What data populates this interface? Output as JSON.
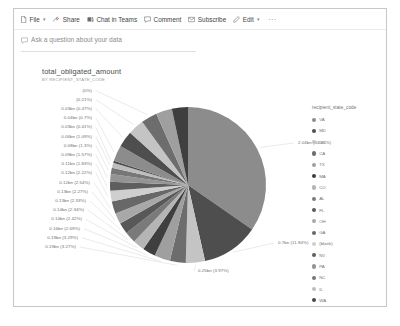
{
  "command_bar": {
    "items": [
      {
        "label": "File",
        "icon": "file-icon",
        "has_chevron": true
      },
      {
        "label": "Share",
        "icon": "share-icon",
        "has_chevron": false
      },
      {
        "label": "Chat in Teams",
        "icon": "teams-icon",
        "has_chevron": false
      },
      {
        "label": "Comment",
        "icon": "comment-icon",
        "has_chevron": false
      },
      {
        "label": "Subscribe",
        "icon": "subscribe-icon",
        "has_chevron": false
      },
      {
        "label": "Edit",
        "icon": "pencil-icon",
        "has_chevron": true
      }
    ],
    "overflow_label": "···"
  },
  "qa_bar": {
    "icon": "qa-icon",
    "placeholder": "Ask a question about your data"
  },
  "chart_data": {
    "type": "pie",
    "title": "total_obligated_amount",
    "subtitle": "BY RECIPIENT_STATE_CODE",
    "legend_title": "recipient_state_code",
    "legend_position": "right",
    "unit": "bn",
    "categories": [
      "VA",
      "MD",
      "DC",
      "CA",
      "TX",
      "MA",
      "CO",
      "AL",
      "FL",
      "OH",
      "GA",
      "(blank)",
      "NV",
      "PA",
      "NC",
      "IL",
      "WA"
    ],
    "values": [
      2.04,
      0.7,
      0.25,
      0.19,
      0.19,
      0.16,
      0.14,
      0.14,
      0.13,
      0.12,
      0.12,
      0.11,
      0.09,
      0.09,
      0.08,
      0.04,
      0.03
    ],
    "percents": [
      34.65,
      11.84,
      3.97,
      3.27,
      3.29,
      2.69,
      2.42,
      2.34,
      2.33,
      2.27,
      2.54,
      2.22,
      1.83,
      1.57,
      1.3,
      1.09,
      0.41
    ],
    "labels": [
      "2.04bn (34.65%)",
      "0.7bn (11.84%)",
      "0.25bn (3.97%)",
      "0.19bn (3.27%)",
      "0.19bn (3.29%)",
      "0.16bn (2.69%)",
      "0.14bn (2.42%)",
      "0.14bn (2.34%)",
      "0.13bn (2.33%)",
      "0.13bn (2.27%)",
      "0.12bn (2.54%)",
      "0.12bn (2.22%)",
      "0.11bn (1.83%)",
      "0.09bn (1.57%)",
      "0.08bn (1.3%)",
      "0.06bn (1.09%)",
      "0.03bn (0.41%)",
      "0.04bn (0.7%)",
      "0.03bn (0.47%)",
      "(0.21%)",
      "(0%)"
    ],
    "colors": [
      "#8c8c8c",
      "#4e4e4e",
      "#c4c4c4",
      "#6d6d6d",
      "#9f9f9f",
      "#3f3f3f",
      "#b5b5b5",
      "#7a7a7a",
      "#585858",
      "#a8a8a8",
      "#686868",
      "#cfcfcf",
      "#5e5e5e",
      "#949494",
      "#777777",
      "#bdbdbd",
      "#4a4a4a"
    ]
  }
}
